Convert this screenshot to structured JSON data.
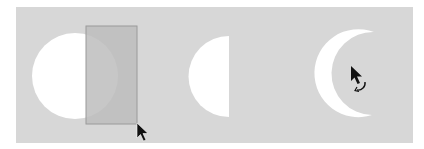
{
  "illustration": {
    "description": "Shape-building steps: a circle with a selection rectangle dragged over its right half, resulting half-circle, then a crescent being rotated",
    "colors": {
      "canvas_background": "#d7d7d7",
      "shape_fill": "#ffffff",
      "selection_fill": "#bdbdbd",
      "selection_border": "#9a9a9a",
      "cursor": "#111111"
    },
    "steps": [
      {
        "label": "circle-with-selection",
        "shape": "circle",
        "tool": "selection-rectangle",
        "cursor": "arrow-cursor"
      },
      {
        "label": "half-circle",
        "shape": "half-circle"
      },
      {
        "label": "crescent-rotate",
        "shape": "crescent",
        "cursor": "rotate-cursor"
      }
    ]
  }
}
